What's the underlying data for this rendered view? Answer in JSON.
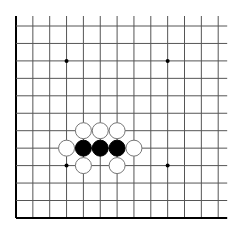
{
  "board": {
    "description": "Partial Go board (upper-left corner region) with stones",
    "columns": 13,
    "rows": 12,
    "origin_x": 16,
    "origin_y": 26,
    "spacing_x": 16.85,
    "spacing_y": 17.45,
    "line_color": "#555555",
    "edge_color": "#000000",
    "background": "#ffffff",
    "edges": {
      "left": true,
      "bottom": true,
      "top": false,
      "right": false
    },
    "star_points": [
      {
        "col": 3,
        "row": 2
      },
      {
        "col": 9,
        "row": 2
      },
      {
        "col": 3,
        "row": 8
      },
      {
        "col": 9,
        "row": 8
      }
    ],
    "stones": [
      {
        "color": "white",
        "col": 4,
        "row": 6
      },
      {
        "color": "white",
        "col": 5,
        "row": 6
      },
      {
        "color": "white",
        "col": 6,
        "row": 6
      },
      {
        "color": "white",
        "col": 3,
        "row": 7
      },
      {
        "color": "black",
        "col": 4,
        "row": 7
      },
      {
        "color": "black",
        "col": 5,
        "row": 7
      },
      {
        "color": "black",
        "col": 6,
        "row": 7
      },
      {
        "color": "white",
        "col": 7,
        "row": 7
      },
      {
        "color": "white",
        "col": 4,
        "row": 8
      },
      {
        "color": "white",
        "col": 6,
        "row": 8
      }
    ],
    "colors": {
      "black_stone": "#000000",
      "white_stone": "#ffffff",
      "white_stone_outline": "#777777"
    }
  }
}
